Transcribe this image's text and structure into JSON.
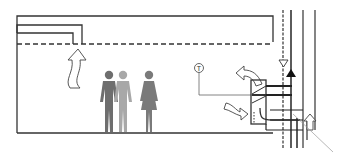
{
  "diagram": {
    "type": "ventilation-schematic",
    "colors": {
      "line": "#333333",
      "person_dark": "#6e6e6e",
      "person_light": "#a8a8a8",
      "person_female": "#7a7a7a",
      "leader": "#999999",
      "background": "#ffffff"
    },
    "thermostat": {
      "label": "T"
    },
    "occupants": [
      {
        "name": "man-dark"
      },
      {
        "name": "man-light"
      },
      {
        "name": "woman"
      }
    ],
    "arrows": [
      {
        "name": "rising-warm-air",
        "direction": "up"
      },
      {
        "name": "supply-air-out",
        "direction": "up-left"
      },
      {
        "name": "return-air-in",
        "direction": "down-right"
      },
      {
        "name": "fresh-air-intake",
        "direction": "up"
      }
    ],
    "riser_markers": [
      {
        "name": "supply-down-triangle",
        "shape": "open-triangle-down"
      },
      {
        "name": "return-up-triangle",
        "shape": "filled-triangle-up"
      }
    ]
  }
}
